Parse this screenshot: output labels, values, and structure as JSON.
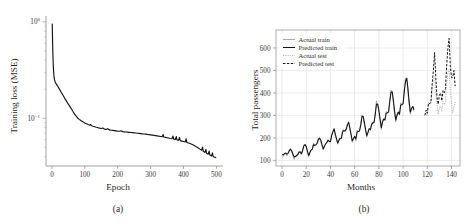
{
  "figure": {
    "panel_a_caption": "(a)",
    "panel_b_caption": "(b)"
  },
  "chart_data": [
    {
      "type": "line",
      "id": "training-loss",
      "title": "",
      "xlabel": "Epoch",
      "ylabel": "Training loss (MSE)",
      "yscale": "log",
      "xlim": [
        -18,
        520
      ],
      "ylim": [
        0.032,
        1.15
      ],
      "grid": false,
      "legend_position": "none",
      "xticks": [
        0,
        100,
        200,
        300,
        400,
        500
      ],
      "xticklabels": [
        "0",
        "100",
        "200",
        "300",
        "400",
        "500"
      ],
      "yticks": [
        1,
        0.1
      ],
      "yticklabels": [
        "10⁰",
        "10⁻¹"
      ],
      "series": [
        {
          "name": "Training loss (MSE)",
          "x": [
            1,
            2,
            3,
            4,
            5,
            6,
            7,
            8,
            10,
            12,
            15,
            18,
            22,
            26,
            30,
            35,
            40,
            45,
            50,
            55,
            60,
            65,
            68,
            70,
            72,
            75,
            78,
            80,
            83,
            86,
            90,
            95,
            100,
            105,
            110,
            115,
            118,
            120,
            125,
            130,
            135,
            140,
            145,
            150,
            155,
            160,
            165,
            170,
            175,
            180,
            185,
            190,
            195,
            200,
            205,
            210,
            215,
            220,
            225,
            230,
            235,
            240,
            245,
            250,
            255,
            260,
            265,
            270,
            275,
            280,
            285,
            290,
            295,
            300,
            305,
            310,
            315,
            320,
            325,
            330,
            335,
            338,
            340,
            345,
            350,
            355,
            360,
            365,
            368,
            370,
            375,
            378,
            380,
            385,
            388,
            390,
            395,
            400,
            405,
            408,
            410,
            415,
            420,
            425,
            430,
            435,
            440,
            445,
            450,
            455,
            458,
            460,
            465,
            468,
            470,
            475,
            478,
            480,
            485,
            488,
            490,
            495,
            498
          ],
          "y": [
            0.95,
            0.62,
            0.45,
            0.36,
            0.31,
            0.28,
            0.262,
            0.25,
            0.238,
            0.23,
            0.222,
            0.214,
            0.203,
            0.192,
            0.182,
            0.17,
            0.159,
            0.149,
            0.14,
            0.132,
            0.124,
            0.116,
            0.112,
            0.109,
            0.107,
            0.104,
            0.101,
            0.0995,
            0.0975,
            0.0958,
            0.0938,
            0.0915,
            0.0895,
            0.0878,
            0.0862,
            0.0848,
            0.0862,
            0.0838,
            0.0826,
            0.0816,
            0.0806,
            0.0798,
            0.079,
            0.0784,
            0.0792,
            0.0772,
            0.0766,
            0.078,
            0.0757,
            0.0752,
            0.0748,
            0.0744,
            0.074,
            0.0736,
            0.0733,
            0.0742,
            0.0727,
            0.0724,
            0.0721,
            0.0718,
            0.0715,
            0.0712,
            0.0709,
            0.0706,
            0.0703,
            0.07,
            0.0697,
            0.0694,
            0.069,
            0.0687,
            0.0684,
            0.068,
            0.0677,
            0.0673,
            0.0669,
            0.0665,
            0.0661,
            0.0657,
            0.0652,
            0.0648,
            0.0643,
            0.0678,
            0.0639,
            0.0634,
            0.0629,
            0.0624,
            0.0618,
            0.0613,
            0.0655,
            0.0608,
            0.0602,
            0.0645,
            0.0597,
            0.0591,
            0.0632,
            0.0586,
            0.058,
            0.0574,
            0.0568,
            0.0612,
            0.0562,
            0.0555,
            0.0547,
            0.0538,
            0.0528,
            0.0517,
            0.0505,
            0.0492,
            0.0479,
            0.0466,
            0.0502,
            0.0454,
            0.0443,
            0.0476,
            0.0433,
            0.0424,
            0.0456,
            0.0415,
            0.0407,
            0.0438,
            0.04,
            0.0394,
            0.039
          ]
        }
      ]
    },
    {
      "type": "line",
      "id": "passenger-forecast",
      "title": "",
      "xlabel": "Months",
      "ylabel": "Total passengers",
      "yscale": "linear",
      "xlim": [
        -5,
        147
      ],
      "ylim": [
        75,
        680
      ],
      "grid": true,
      "legend_position": "upper left",
      "xticks": [
        0,
        20,
        40,
        60,
        80,
        100,
        120,
        140
      ],
      "xticklabels": [
        "0",
        "20",
        "40",
        "60",
        "80",
        "100",
        "120",
        "140"
      ],
      "yticks": [
        100,
        200,
        300,
        400,
        500,
        600
      ],
      "yticklabels": [
        "100",
        "200",
        "300",
        "400",
        "500",
        "600"
      ],
      "legend": [
        {
          "label": "Actual train",
          "style": "thin-gray-solid"
        },
        {
          "label": "Predicted train",
          "style": "thick-black-solid"
        },
        {
          "label": "Actual test",
          "style": "light-dotted"
        },
        {
          "label": "Predicted test",
          "style": "black-dashed"
        }
      ],
      "series": [
        {
          "name": "Actual train",
          "x": [
            0,
            1,
            2,
            3,
            4,
            5,
            6,
            7,
            8,
            9,
            10,
            11,
            12,
            13,
            14,
            15,
            16,
            17,
            18,
            19,
            20,
            21,
            22,
            23,
            24,
            25,
            26,
            27,
            28,
            29,
            30,
            31,
            32,
            33,
            34,
            35,
            36,
            37,
            38,
            39,
            40,
            41,
            42,
            43,
            44,
            45,
            46,
            47,
            48,
            49,
            50,
            51,
            52,
            53,
            54,
            55,
            56,
            57,
            58,
            59,
            60,
            61,
            62,
            63,
            64,
            65,
            66,
            67,
            68,
            69,
            70,
            71,
            72,
            73,
            74,
            75,
            76,
            77,
            78,
            79,
            80,
            81,
            82,
            83,
            84,
            85,
            86,
            87,
            88,
            89,
            90,
            91,
            92,
            93,
            94,
            95,
            96,
            97,
            98,
            99,
            100,
            101,
            102,
            103,
            104,
            105,
            106,
            107,
            108,
            109
          ],
          "y": [
            112,
            118,
            132,
            129,
            121,
            135,
            148,
            148,
            136,
            119,
            104,
            118,
            115,
            126,
            141,
            135,
            125,
            149,
            170,
            170,
            158,
            133,
            114,
            140,
            145,
            150,
            178,
            163,
            172,
            178,
            199,
            199,
            184,
            162,
            146,
            166,
            171,
            180,
            193,
            181,
            183,
            218,
            230,
            242,
            209,
            191,
            172,
            194,
            196,
            196,
            236,
            235,
            229,
            243,
            264,
            272,
            237,
            211,
            180,
            201,
            204,
            188,
            235,
            227,
            234,
            264,
            302,
            293,
            259,
            229,
            203,
            229,
            242,
            233,
            267,
            269,
            270,
            315,
            364,
            347,
            312,
            274,
            237,
            278,
            284,
            277,
            317,
            313,
            318,
            374,
            413,
            405,
            355,
            306,
            271,
            306,
            315,
            301,
            356,
            348,
            355,
            422,
            465,
            467,
            404,
            347,
            305,
            336,
            340,
            318
          ]
        },
        {
          "name": "Predicted train",
          "x": [
            0,
            1,
            2,
            3,
            4,
            5,
            6,
            7,
            8,
            9,
            10,
            11,
            12,
            13,
            14,
            15,
            16,
            17,
            18,
            19,
            20,
            21,
            22,
            23,
            24,
            25,
            26,
            27,
            28,
            29,
            30,
            31,
            32,
            33,
            34,
            35,
            36,
            37,
            38,
            39,
            40,
            41,
            42,
            43,
            44,
            45,
            46,
            47,
            48,
            49,
            50,
            51,
            52,
            53,
            54,
            55,
            56,
            57,
            58,
            59,
            60,
            61,
            62,
            63,
            64,
            65,
            66,
            67,
            68,
            69,
            70,
            71,
            72,
            73,
            74,
            75,
            76,
            77,
            78,
            79,
            80,
            81,
            82,
            83,
            84,
            85,
            86,
            87,
            88,
            89,
            90,
            91,
            92,
            93,
            94,
            95,
            96,
            97,
            98,
            99,
            100,
            101,
            102,
            103,
            104,
            105,
            106,
            107,
            108,
            109
          ],
          "y": [
            126,
            124,
            130,
            133,
            128,
            131,
            143,
            150,
            143,
            128,
            115,
            117,
            122,
            126,
            136,
            138,
            130,
            143,
            164,
            170,
            162,
            141,
            122,
            135,
            146,
            150,
            170,
            167,
            169,
            176,
            193,
            199,
            190,
            170,
            152,
            162,
            174,
            180,
            189,
            185,
            183,
            210,
            226,
            240,
            217,
            196,
            177,
            189,
            198,
            199,
            226,
            233,
            230,
            239,
            257,
            269,
            245,
            217,
            187,
            196,
            207,
            196,
            226,
            228,
            231,
            256,
            294,
            296,
            269,
            238,
            210,
            224,
            241,
            237,
            259,
            267,
            268,
            303,
            351,
            350,
            323,
            284,
            246,
            271,
            284,
            280,
            309,
            312,
            315,
            361,
            403,
            405,
            366,
            317,
            280,
            301,
            315,
            305,
            345,
            347,
            352,
            408,
            452,
            465,
            419,
            360,
            315,
            330,
            340,
            325
          ]
        },
        {
          "name": "Actual test",
          "x": [
            118,
            119,
            120,
            121,
            122,
            123,
            124,
            125,
            126,
            127,
            128,
            129,
            130,
            131,
            132,
            133,
            134,
            135,
            136,
            137,
            138,
            139,
            140,
            141,
            142,
            143
          ],
          "y": [
            306,
            315,
            301,
            356,
            348,
            355,
            422,
            465,
            467,
            404,
            347,
            305,
            336,
            340,
            318,
            362,
            348,
            363,
            435,
            491,
            505,
            404,
            359,
            310,
            337,
            360
          ]
        },
        {
          "name": "Predicted test",
          "x": [
            118,
            119,
            120,
            121,
            122,
            123,
            124,
            125,
            126,
            127,
            128,
            129,
            130,
            131,
            132,
            133,
            134,
            135,
            136,
            137,
            138,
            139,
            140,
            141,
            142,
            143
          ],
          "y": [
            300,
            324,
            310,
            355,
            352,
            360,
            440,
            500,
            580,
            470,
            380,
            350,
            392,
            400,
            365,
            410,
            400,
            420,
            520,
            600,
            643,
            520,
            468,
            470,
            500,
            430
          ]
        }
      ]
    }
  ]
}
